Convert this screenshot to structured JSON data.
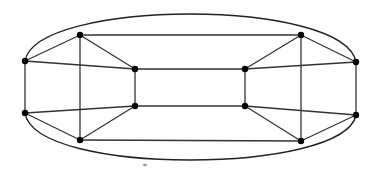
{
  "diagram": {
    "type": "graph",
    "colors": {
      "edge": "#333333",
      "vertex": "#000000",
      "curve": "#222222",
      "background": "#ffffff"
    },
    "vertices": [
      {
        "id": "L1",
        "x": 25,
        "y": 61
      },
      {
        "id": "L2",
        "x": 25,
        "y": 113
      },
      {
        "id": "TL",
        "x": 80,
        "y": 35
      },
      {
        "id": "BL",
        "x": 80,
        "y": 140
      },
      {
        "id": "IL1",
        "x": 135,
        "y": 69
      },
      {
        "id": "IL2",
        "x": 135,
        "y": 106
      },
      {
        "id": "IR1",
        "x": 245,
        "y": 69
      },
      {
        "id": "IR2",
        "x": 245,
        "y": 106
      },
      {
        "id": "TR",
        "x": 301,
        "y": 35
      },
      {
        "id": "BR",
        "x": 301,
        "y": 141
      },
      {
        "id": "R1",
        "x": 356,
        "y": 62
      },
      {
        "id": "R2",
        "x": 356,
        "y": 115
      }
    ],
    "edges": [
      [
        "L1",
        "L2"
      ],
      [
        "L1",
        "TL"
      ],
      [
        "L1",
        "IL1"
      ],
      [
        "L2",
        "BL"
      ],
      [
        "L2",
        "IL2"
      ],
      [
        "TL",
        "BL"
      ],
      [
        "TL",
        "IL1"
      ],
      [
        "BL",
        "IL2"
      ],
      [
        "IL1",
        "IL2"
      ],
      [
        "TL",
        "TR"
      ],
      [
        "BL",
        "BR"
      ],
      [
        "IL1",
        "IR1"
      ],
      [
        "IL2",
        "IR2"
      ],
      [
        "IR1",
        "IR2"
      ],
      [
        "TR",
        "BR"
      ],
      [
        "TR",
        "IR1"
      ],
      [
        "BR",
        "IR2"
      ],
      [
        "R1",
        "R2"
      ],
      [
        "R1",
        "TR"
      ],
      [
        "R1",
        "IR1"
      ],
      [
        "R2",
        "BR"
      ],
      [
        "R2",
        "IR2"
      ]
    ],
    "curves": [
      {
        "id": "top-arc",
        "from": "L1",
        "to": "R1",
        "d": "M25,61 C30,30 110,14 190,14 C270,14 350,30 356,62"
      },
      {
        "id": "bottom-arc",
        "from": "L2",
        "to": "R2",
        "d": "M25,113 C30,145 110,160 190,160 C270,160 350,145 356,115"
      }
    ],
    "stray_mark": {
      "x": 145,
      "y": 165
    }
  }
}
